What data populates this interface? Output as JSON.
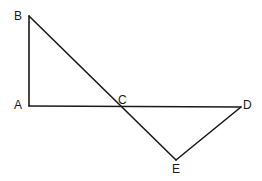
{
  "diagram": {
    "type": "geometry",
    "points": {
      "A": {
        "label": "A",
        "x": 29,
        "y": 106
      },
      "B": {
        "label": "B",
        "x": 29,
        "y": 16
      },
      "C": {
        "label": "C",
        "x": 121,
        "y": 106
      },
      "D": {
        "label": "D",
        "x": 241,
        "y": 107
      },
      "E": {
        "label": "E",
        "x": 176,
        "y": 160
      }
    },
    "segments": [
      {
        "from": "A",
        "to": "B"
      },
      {
        "from": "B",
        "to": "E"
      },
      {
        "from": "A",
        "to": "D"
      },
      {
        "from": "D",
        "to": "E"
      }
    ],
    "labels": {
      "A": "A",
      "B": "B",
      "C": "C",
      "D": "D",
      "E": "E"
    }
  }
}
